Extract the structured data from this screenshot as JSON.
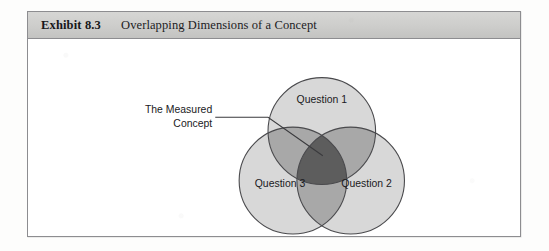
{
  "exhibit": {
    "number": "Exhibit 8.3",
    "title": "Overlapping Dimensions of a Concept"
  },
  "diagram": {
    "type": "venn-3-circle",
    "callout": {
      "line1": "The Measured",
      "line2": "Concept",
      "points_to": "triple-intersection"
    },
    "circles": [
      {
        "id": "question-1",
        "label": "Question 1",
        "position": "top"
      },
      {
        "id": "question-2",
        "label": "Question 2",
        "position": "bottom-right"
      },
      {
        "id": "question-3",
        "label": "Question 3",
        "position": "bottom-left"
      }
    ],
    "colors": {
      "circle_fill": "#d8d8d8",
      "pair_overlap_fill": "#a8a8a8",
      "triple_overlap_fill": "#5d5d5d",
      "outline": "#4a4a4d",
      "header_band": "#cdcdcb",
      "frame_border": "#8d8d90"
    }
  }
}
